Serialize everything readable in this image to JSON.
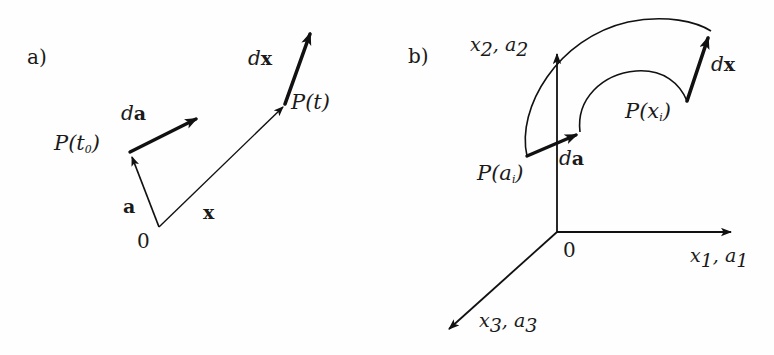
{
  "figure": {
    "background_color": "#fefefe",
    "ink_color": "#111111",
    "width": 774,
    "height": 355
  },
  "panel_a": {
    "tag": "a)",
    "labels": {
      "origin": "0",
      "point_start_P": "P",
      "point_start_arg_open": "(",
      "point_start_t": "t",
      "point_start_sub": "0",
      "point_start_arg_close": ")",
      "point_end_P": "P",
      "point_end_arg_open": "(",
      "point_end_t": "t",
      "point_end_arg_close": ")",
      "vector_a": "a",
      "vector_x": "x",
      "diff_a_prefix": "d",
      "diff_a_vec": "a",
      "diff_x_prefix": "d",
      "diff_x_vec": "x"
    }
  },
  "panel_b": {
    "tag": "b)",
    "labels": {
      "origin": "0",
      "axis_x1": "x",
      "axis_x1_sub": "1",
      "axis_x1_comma": ", ",
      "axis_a1": "a",
      "axis_a1_sub": "1",
      "axis_x2": "x",
      "axis_x2_sub": "2",
      "axis_x2_comma": ", ",
      "axis_a2": "a",
      "axis_a2_sub": "2",
      "axis_x3": "x",
      "axis_x3_sub": "3",
      "axis_x3_comma": ", ",
      "axis_a3": "a",
      "axis_a3_sub": "3",
      "point_a_P": "P",
      "point_a_open": "(",
      "point_a_var": "a",
      "point_a_sub": "i",
      "point_a_close": ")",
      "point_x_P": "P",
      "point_x_open": "(",
      "point_x_var": "x",
      "point_x_sub": "i",
      "point_x_close": ")",
      "diff_a_prefix": "d",
      "diff_a_vec": "a",
      "diff_x_prefix": "d",
      "diff_x_vec": "x"
    }
  },
  "geometry": {
    "panel_a": {
      "origin_point": [
        159,
        227
      ],
      "P_t0_point": [
        130,
        152
      ],
      "da_tip": [
        200,
        116
      ],
      "P_t_point": [
        285,
        104
      ],
      "dx_tip": [
        313,
        27
      ]
    },
    "panel_b": {
      "origin_point": [
        557,
        232
      ],
      "x1_axis_tip": [
        737,
        232
      ],
      "x2_axis_tip": [
        557,
        48
      ],
      "x3_axis_tip": [
        443,
        335
      ],
      "P_ai_point": [
        527,
        156
      ],
      "da_tip": [
        580,
        132
      ],
      "P_xi_point": [
        687,
        101
      ],
      "dx_tip": [
        711,
        31
      ],
      "upper_curve": "from P(ai) up over the top to dx tip",
      "lower_curve": "from da tip arcing right to P(xi)"
    }
  }
}
